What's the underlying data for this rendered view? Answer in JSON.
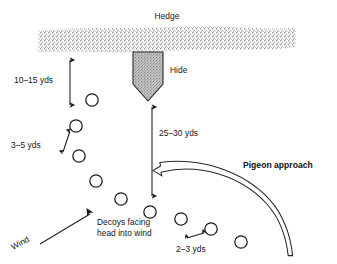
{
  "diagram": {
    "title_visible": false,
    "background_color": "#ffffff",
    "ink_color": "#1a1a1a",
    "labels": {
      "hedge": "Hedge",
      "hide": "Hide",
      "dist_hedge_to_decoys": "10–15 yds",
      "dist_decoy_spacing_left": "3–5 yds",
      "dist_hide_to_decoys": "25–30 yds",
      "dist_decoy_spacing_right": "2–3 yds",
      "pigeon_approach": "Pigeon approach",
      "wind": "Wind",
      "decoys_note_line1": "Decoys facing",
      "decoys_note_line2": "head into wind"
    },
    "hedge": {
      "name": "hedge-band",
      "x": 38,
      "y": 27,
      "width": 258,
      "height": 25,
      "fill_pattern": "stipple",
      "stipple_color": "#6e6e6e"
    },
    "hide": {
      "name": "hide-shape",
      "shape": "shield-pointed-down",
      "x": 133,
      "y": 52,
      "width": 30,
      "height": 48,
      "fill_pattern": "stipple",
      "fill_color": "#9a9a9a"
    },
    "decoys": [
      {
        "cx": 92,
        "cy": 100,
        "r": 6.2
      },
      {
        "cx": 76,
        "cy": 126,
        "r": 6.2
      },
      {
        "cx": 79,
        "cy": 156,
        "r": 6.2
      },
      {
        "cx": 96,
        "cy": 181,
        "r": 6.2
      },
      {
        "cx": 121,
        "cy": 199,
        "r": 6.2
      },
      {
        "cx": 150,
        "cy": 212,
        "r": 6.2
      },
      {
        "cx": 181,
        "cy": 219,
        "r": 6.2
      },
      {
        "cx": 211,
        "cy": 229,
        "r": 6.2
      },
      {
        "cx": 241,
        "cy": 242,
        "r": 6.2
      }
    ],
    "arrows": {
      "hedge_to_decoys": {
        "x": 70,
        "y1": 58,
        "y2": 107,
        "double_headed": true
      },
      "decoy_spacing_left": {
        "x1": 62,
        "y1": 152,
        "x2": 70,
        "y2": 132,
        "double_headed": true
      },
      "hide_to_decoys": {
        "x": 152,
        "y1": 104,
        "y2": 198,
        "double_headed": true
      },
      "decoy_spacing_right": {
        "x1": 186,
        "y1": 237,
        "x2": 205,
        "y2": 232,
        "double_headed": true
      },
      "wind": {
        "x1": 36,
        "y1": 245,
        "x2": 90,
        "y2": 215
      },
      "pigeon_approach_curve": {
        "description": "large open-outline curved arrow sweeping from lower-right up and left, arrowhead pointing left",
        "head_x": 157,
        "head_y": 170,
        "tail_x": 290,
        "tail_y": 256
      }
    },
    "label_positions": {
      "hedge": {
        "x": 167,
        "y": 19,
        "anchor": "middle",
        "rotate": 0
      },
      "hide": {
        "x": 170,
        "y": 73,
        "anchor": "start",
        "rotate": 0
      },
      "dist_hedge_to_decoys": {
        "x": 14,
        "y": 83,
        "anchor": "start",
        "rotate": 0
      },
      "dist_decoy_spacing_left": {
        "x": 12,
        "y": 148,
        "anchor": "start",
        "rotate": 0
      },
      "dist_hide_to_decoys": {
        "x": 159,
        "y": 136,
        "anchor": "start",
        "rotate": 0
      },
      "dist_decoy_spacing_right": {
        "x": 177,
        "y": 252,
        "anchor": "start",
        "rotate": 0
      },
      "pigeon_approach": {
        "x": 243,
        "y": 168,
        "anchor": "start",
        "rotate": 0
      },
      "wind": {
        "x": 13,
        "y": 248,
        "anchor": "start",
        "rotate": -28
      },
      "decoys_note_line1": {
        "x": 97,
        "y": 225,
        "anchor": "start",
        "rotate": 0
      },
      "decoys_note_line2": {
        "x": 97,
        "y": 236,
        "anchor": "start",
        "rotate": 0
      }
    }
  }
}
